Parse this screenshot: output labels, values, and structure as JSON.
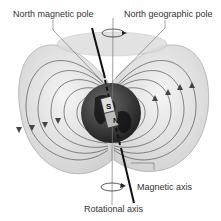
{
  "diagram": {
    "labels": {
      "north_magnetic_pole": "North magnetic pole",
      "north_geographic_pole": "North geographic pole",
      "magnetic_axis": "Magnetic axis",
      "rotational_axis": "Rotational axis"
    },
    "magnet": {
      "top_pole": "S",
      "bottom_pole": "N"
    },
    "colors": {
      "field_fill": "#e6e6e6",
      "field_lines": "#555555",
      "earth": "#3a3a3a",
      "axis": "#111111"
    }
  }
}
